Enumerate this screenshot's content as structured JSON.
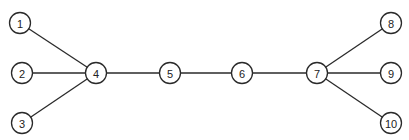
{
  "diagram": {
    "type": "graph",
    "colors": {
      "stroke": "#2a2a2a",
      "node_fill": "#ffffff",
      "text": "#222222"
    },
    "node_radius": 10.5,
    "nodes": [
      {
        "id": "1",
        "label": "1",
        "x": 20,
        "y": 23
      },
      {
        "id": "2",
        "label": "2",
        "x": 22,
        "y": 73
      },
      {
        "id": "3",
        "label": "3",
        "x": 22,
        "y": 123
      },
      {
        "id": "4",
        "label": "4",
        "x": 96,
        "y": 73
      },
      {
        "id": "5",
        "label": "5",
        "x": 170,
        "y": 73
      },
      {
        "id": "6",
        "label": "6",
        "x": 242,
        "y": 73
      },
      {
        "id": "7",
        "label": "7",
        "x": 317,
        "y": 73
      },
      {
        "id": "8",
        "label": "8",
        "x": 391,
        "y": 23
      },
      {
        "id": "9",
        "label": "9",
        "x": 391,
        "y": 73
      },
      {
        "id": "10",
        "label": "10",
        "x": 391,
        "y": 123
      }
    ],
    "edges": [
      {
        "from": "1",
        "to": "4"
      },
      {
        "from": "2",
        "to": "4"
      },
      {
        "from": "3",
        "to": "4"
      },
      {
        "from": "4",
        "to": "5"
      },
      {
        "from": "5",
        "to": "6"
      },
      {
        "from": "6",
        "to": "7"
      },
      {
        "from": "7",
        "to": "8"
      },
      {
        "from": "7",
        "to": "9"
      },
      {
        "from": "7",
        "to": "10"
      }
    ]
  }
}
